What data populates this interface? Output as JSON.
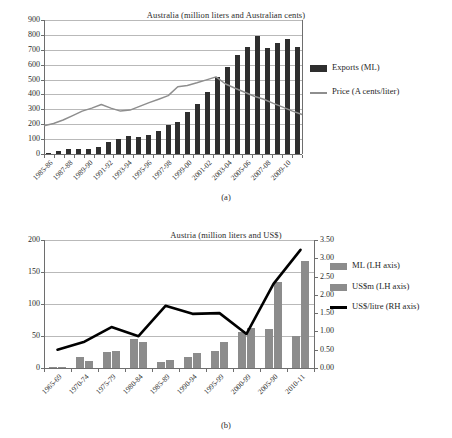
{
  "figure": {
    "panel_a_caption": "(a)",
    "panel_b_caption": "(b)"
  },
  "chart_data": [
    {
      "id": "australia",
      "type": "bar",
      "title": "Australia (million liters and Australian cents)",
      "xlabel": "",
      "ylabel": "",
      "ylim": [
        0,
        900
      ],
      "yticks": [
        "0",
        "100",
        "200",
        "300",
        "400",
        "500",
        "600",
        "700",
        "800",
        "900"
      ],
      "grid": true,
      "legend_position": "right",
      "categories": [
        "1985-86",
        "1986-87",
        "1987-88",
        "1988-89",
        "1989-90",
        "1990-91",
        "1991-92",
        "1992-93",
        "1993-94",
        "1994-95",
        "1995-96",
        "1996-97",
        "1997-98",
        "1998-99",
        "1999-00",
        "2000-01",
        "2001-02",
        "2002-03",
        "2003-04",
        "2004-05",
        "2005-06",
        "2006-07",
        "2007-08",
        "2008-09",
        "2009-10"
      ],
      "tick_labels": [
        "1985-86",
        "1987-88",
        "1989-90",
        "1991-92",
        "1993-94",
        "1995-96",
        "1997-98",
        "1999-00",
        "2001-02",
        "2003-04",
        "2005-06",
        "2007-08",
        "2009-10"
      ],
      "series": [
        {
          "name": "Exports (ML)",
          "kind": "bar",
          "color": "#2e2e2e",
          "values": [
            10,
            20,
            35,
            35,
            35,
            45,
            78,
            100,
            122,
            113,
            128,
            152,
            194,
            216,
            285,
            338,
            415,
            518,
            582,
            668,
            720,
            790,
            712,
            748,
            775,
            722
          ]
        },
        {
          "name": "Price (A cents/liter)",
          "kind": "line",
          "color": "#8e8e8e",
          "values": [
            190,
            205,
            228,
            258,
            288,
            308,
            332,
            308,
            288,
            295,
            320,
            345,
            368,
            392,
            452,
            460,
            478,
            498,
            518,
            470,
            442,
            415,
            388,
            368,
            340,
            315,
            288,
            265
          ]
        }
      ]
    },
    {
      "id": "austria",
      "type": "bar",
      "title": "Austria (million liters and US$)",
      "xlabel": "",
      "ylabel": "",
      "ylim": [
        0,
        200
      ],
      "yticks": [
        "0",
        "50",
        "100",
        "150",
        "200"
      ],
      "y2lim": [
        0,
        3.5
      ],
      "y2ticks": [
        "0.00",
        "0.50",
        "1.00",
        "1.50",
        "2.00",
        "2.50",
        "3.00",
        "3.50"
      ],
      "grid": true,
      "legend_position": "right",
      "categories": [
        "1965-69",
        "1970-74",
        "1975-79",
        "1980-84",
        "1985-89",
        "1990-94",
        "1995-99",
        "2000-99",
        "2005-90",
        "2010-11"
      ],
      "series": [
        {
          "name": "ML (LH axis)",
          "kind": "bar",
          "axis": "left",
          "color": "#8c8c8c",
          "values": [
            2,
            17,
            25,
            45,
            10,
            17,
            27,
            57,
            61,
            50
          ]
        },
        {
          "name": "US$m (LH axis)",
          "kind": "bar",
          "axis": "left",
          "color": "#8c8c8c",
          "values": [
            1,
            11,
            27,
            41,
            12,
            24,
            40,
            63,
            135,
            167
          ]
        },
        {
          "name": "US$/litre (RH axis)",
          "kind": "line",
          "axis": "right",
          "color": "#000000",
          "values": [
            0.5,
            0.72,
            1.12,
            0.87,
            1.7,
            1.48,
            1.5,
            0.93,
            2.3,
            3.23
          ]
        }
      ]
    }
  ]
}
